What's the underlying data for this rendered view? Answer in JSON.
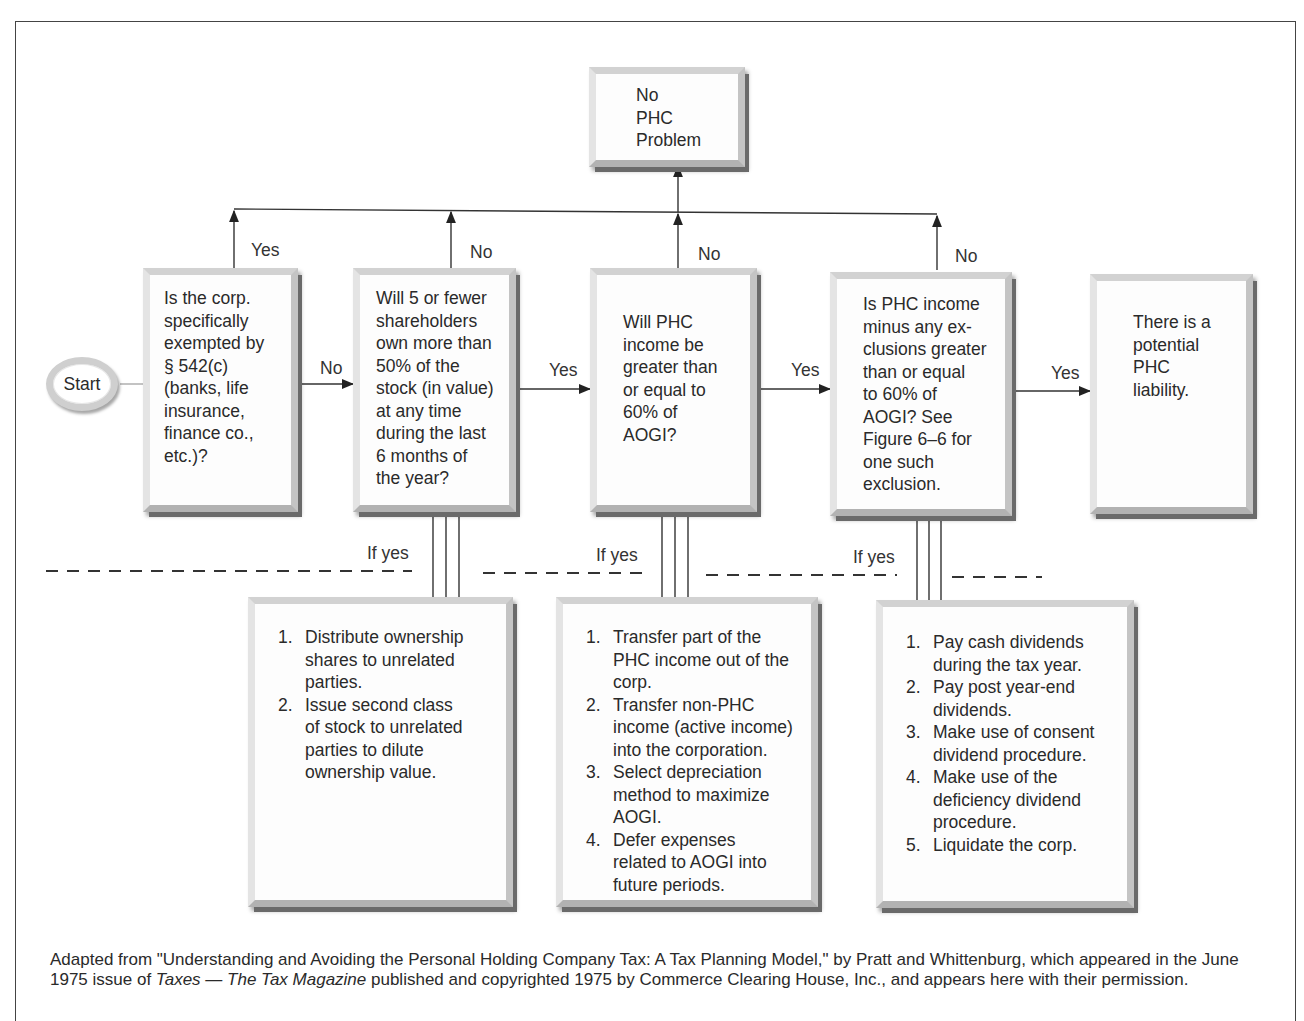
{
  "figure": {
    "start_label": "Start",
    "top_terminal": "No\nPHC\nProblem",
    "decisions": [
      {
        "id": "q1",
        "text": "Is the corp.\nspecifically\nexempted by\n§ 542(c)\n(banks, life\ninsurance,\nfinance co.,\netc.)?",
        "up_label": "Yes",
        "right_label": "No"
      },
      {
        "id": "q2",
        "text": "Will 5 or fewer\nshareholders\nown more than\n50% of the\nstock (in value)\nat any time\nduring the last\n6 months of\nthe year?",
        "up_label": "No",
        "right_label": "Yes"
      },
      {
        "id": "q3",
        "text": "Will PHC\nincome be\ngreater than\nor equal to\n60% of\nAOGI?",
        "up_label": "No",
        "right_label": "Yes"
      },
      {
        "id": "q4",
        "text": "Is PHC income\nminus any ex-\nclusions greater\nthan or equal\nto 60% of\nAOGI? See\nFigure 6–6 for\none such\nexclusion.",
        "up_label": "No",
        "right_label": "Yes"
      }
    ],
    "final_terminal": "There is a\npotential\nPHC\nliability.",
    "if_yes_labels": [
      "If yes",
      "If yes",
      "If yes"
    ],
    "remedies": [
      {
        "for": "q2",
        "items": [
          "Distribute ownership\nshares to unrelated\nparties.",
          "Issue second class\nof stock to unrelated\nparties to dilute\nownership value."
        ]
      },
      {
        "for": "q3",
        "items": [
          "Transfer part of the\nPHC income out of the\ncorp.",
          "Transfer non-PHC\nincome (active income)\ninto the corporation.",
          "Select depreciation\nmethod to maximize\nAOGI.",
          "Defer expenses\nrelated to AOGI into\nfuture periods."
        ]
      },
      {
        "for": "q4",
        "items": [
          "Pay cash dividends\nduring the tax year.",
          "Pay post year-end\ndividends.",
          "Make use of consent\ndividend procedure.",
          "Make use of the\ndeficiency dividend\nprocedure.",
          "Liquidate the corp."
        ]
      }
    ]
  },
  "caption": {
    "before": "Adapted from \"Understanding and Avoiding the Personal Holding Company Tax: A Tax Planning Model,\" by Pratt and Whittenburg, which appeared in the June 1975 issue of ",
    "italic": "Taxes — The Tax Magazine",
    "after": " published and copyrighted 1975 by Commerce Clearing House, Inc., and appears here with their permission."
  }
}
